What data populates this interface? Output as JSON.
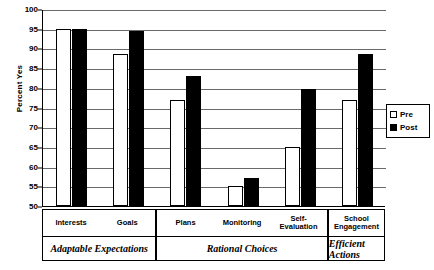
{
  "chart_data": {
    "type": "bar",
    "title": "",
    "xlabel": "",
    "ylabel": "Percent Yes",
    "ylim": [
      50,
      100
    ],
    "ytick_step": 5,
    "yticks": [
      100,
      95,
      90,
      85,
      80,
      75,
      70,
      65,
      60,
      55,
      50
    ],
    "grid": true,
    "legend_position": "right",
    "categories": [
      "Interests",
      "Goals",
      "Plans",
      "Monitoring",
      "Self-\nEvaluation",
      "School Engagement"
    ],
    "group_labels": [
      "Adaptable Expectations",
      "Rational Choices",
      "Efficient Actions"
    ],
    "group_spans": [
      2,
      3,
      1
    ],
    "series": [
      {
        "name": "Pre",
        "color": "#ffffff",
        "values": [
          95.0,
          88.5,
          77.0,
          55.0,
          65.0,
          77.0
        ]
      },
      {
        "name": "Post",
        "color": "#000000",
        "values": [
          95.0,
          94.5,
          83.0,
          57.0,
          79.8,
          88.7
        ]
      }
    ]
  },
  "legend": {
    "entries": [
      {
        "label": "Pre",
        "style": "pre"
      },
      {
        "label": "Post",
        "style": "post"
      }
    ]
  }
}
